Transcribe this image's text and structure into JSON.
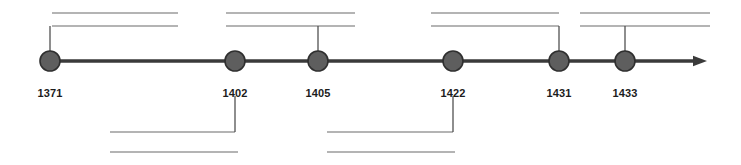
{
  "figure": {
    "type": "horizontal-timeline",
    "width": 741,
    "height": 165,
    "background_color": "#ffffff",
    "axis": {
      "name": "timeline-axis",
      "orientation": "horizontal",
      "y": 61,
      "x_start": 50,
      "x_end": 707,
      "has_arrowhead_right": true,
      "color": "#3a3a3a",
      "stroke_width": 3.4
    },
    "node_style": {
      "shape": "circle",
      "radius": 10,
      "fill_color": "#5e5e5e",
      "stroke_color": "#2f2f2f"
    },
    "leader_color": "#4a4a4a",
    "rule_color": "#6b6b6b"
  },
  "events": [
    {
      "id": "event-1371",
      "label": "1371",
      "x": 50,
      "label_y": 88,
      "callout_side": "top",
      "leader_shape": "elbow-right",
      "text_lines": [
        "",
        ""
      ]
    },
    {
      "id": "event-1402",
      "label": "1402",
      "x": 235,
      "label_y": 88,
      "callout_side": "bottom",
      "leader_shape": "elbow-left",
      "text_lines": [
        "",
        ""
      ]
    },
    {
      "id": "event-1405",
      "label": "1405",
      "x": 318,
      "label_y": 88,
      "callout_side": "top",
      "leader_shape": "straight",
      "text_lines": [
        "",
        ""
      ]
    },
    {
      "id": "event-1422",
      "label": "1422",
      "x": 453,
      "label_y": 88,
      "callout_side": "bottom",
      "leader_shape": "elbow-left",
      "text_lines": [
        "",
        ""
      ]
    },
    {
      "id": "event-1431",
      "label": "1431",
      "x": 559,
      "label_y": 88,
      "callout_side": "top",
      "leader_shape": "elbow-left",
      "text_lines": [
        "",
        ""
      ]
    },
    {
      "id": "event-1433",
      "label": "1433",
      "x": 625,
      "label_y": 88,
      "callout_side": "top",
      "leader_shape": "straight",
      "text_lines": [
        "",
        ""
      ]
    }
  ],
  "callouts": {
    "top": [
      {
        "id": "callout-top-1371",
        "event": "1371",
        "rule_1": {
          "x1": 52,
          "x2": 178,
          "y": 13
        },
        "rule_2": {
          "x1": 52,
          "x2": 178,
          "y": 26
        },
        "leader_path": "M 50 51 L 50 26",
        "text_lines": [
          "",
          ""
        ]
      },
      {
        "id": "callout-top-1405",
        "event": "1405",
        "rule_1": {
          "x1": 226,
          "x2": 355,
          "y": 13
        },
        "rule_2": {
          "x1": 226,
          "x2": 355,
          "y": 26
        },
        "leader_path": "M 318 51 L 318 26",
        "text_lines": [
          "",
          ""
        ]
      },
      {
        "id": "callout-top-1431",
        "event": "1431",
        "rule_1": {
          "x1": 431,
          "x2": 559,
          "y": 13
        },
        "rule_2": {
          "x1": 431,
          "x2": 559,
          "y": 26
        },
        "leader_path": "M 559 51 L 559 26",
        "text_lines": [
          "",
          ""
        ]
      },
      {
        "id": "callout-top-1433",
        "event": "1433",
        "rule_1": {
          "x1": 580,
          "x2": 710,
          "y": 13
        },
        "rule_2": {
          "x1": 580,
          "x2": 710,
          "y": 26
        },
        "leader_path": "M 625 51 L 625 26",
        "text_lines": [
          "",
          ""
        ]
      }
    ],
    "bottom": [
      {
        "id": "callout-bottom-1402",
        "event": "1402",
        "rule_1": {
          "x1": 110,
          "x2": 235,
          "y": 132
        },
        "rule_2": {
          "x1": 110,
          "x2": 238,
          "y": 152
        },
        "leader_path": "M 235 96 L 235 132",
        "text_lines": [
          "",
          ""
        ]
      },
      {
        "id": "callout-bottom-1422",
        "event": "1422",
        "rule_1": {
          "x1": 327,
          "x2": 453,
          "y": 132
        },
        "rule_2": {
          "x1": 327,
          "x2": 455,
          "y": 152
        },
        "leader_path": "M 453 96 L 453 132",
        "text_lines": [
          "",
          ""
        ]
      }
    ]
  }
}
